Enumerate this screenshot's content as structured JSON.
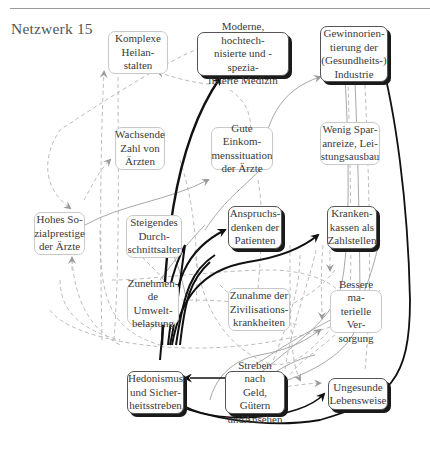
{
  "title": "Netzwerk 15",
  "nodes": [
    {
      "id": "heilanstalten",
      "label": "Komplexe\nHeilan-\nstalten",
      "emphasis": false
    },
    {
      "id": "medizin",
      "label": "Moderne, hochtech-\nnisierte und -spezia-\nlisierte Medizin",
      "emphasis": true
    },
    {
      "id": "industrie",
      "label": "Gewinnorien-\ntierung der\n(Gesundheits-)\nIndustrie",
      "emphasis": true
    },
    {
      "id": "zahl_aerzte",
      "label": "Wachsende\nZahl von\nÄrzten",
      "emphasis": false
    },
    {
      "id": "einkommen",
      "label": "Gute Einkom-\nmenssituation\nder Ärzte",
      "emphasis": false
    },
    {
      "id": "sparanreize",
      "label": "Wenig Spar-\nanreize, Lei-\nstungsausbau",
      "emphasis": false
    },
    {
      "id": "sozialprestige",
      "label": "Hohes So-\nzialprestige\nder Ärzte",
      "emphasis": false
    },
    {
      "id": "durchschnittsalter",
      "label": "Steigendes\nDurch-\nschnittsalter",
      "emphasis": false
    },
    {
      "id": "anspruchsdenken",
      "label": "Anspruchs-\ndenken der\nPatienten",
      "emphasis": true
    },
    {
      "id": "krankenkassen",
      "label": "Kranken-\nkassen als\nZahlstellen",
      "emphasis": true
    },
    {
      "id": "umweltbelastung",
      "label": "Zunehmen-\nde Umwelt-\nbelastung",
      "emphasis": false
    },
    {
      "id": "zivilisationskrankheiten",
      "label": "Zunahme der\nZivilisations-\nkrankheiten",
      "emphasis": false
    },
    {
      "id": "versorgung",
      "label": "Bessere ma-\nterielle Ver-\nsorgung",
      "emphasis": false
    },
    {
      "id": "hedonismus",
      "label": "Hedonismus\nund Sicher-\nheitsstreben",
      "emphasis": true
    },
    {
      "id": "streben",
      "label": "Streben nach\nGeld, Gütern\nundAnsehen",
      "emphasis": true
    },
    {
      "id": "lebensweise",
      "label": "Ungesunde\nLebensweise",
      "emphasis": true
    }
  ],
  "edge_styles": {
    "strong": "#111111",
    "solid_light": "#a8a8a8",
    "dashed": "#b8b8b8",
    "arrowhead": "#9a9a9a"
  }
}
